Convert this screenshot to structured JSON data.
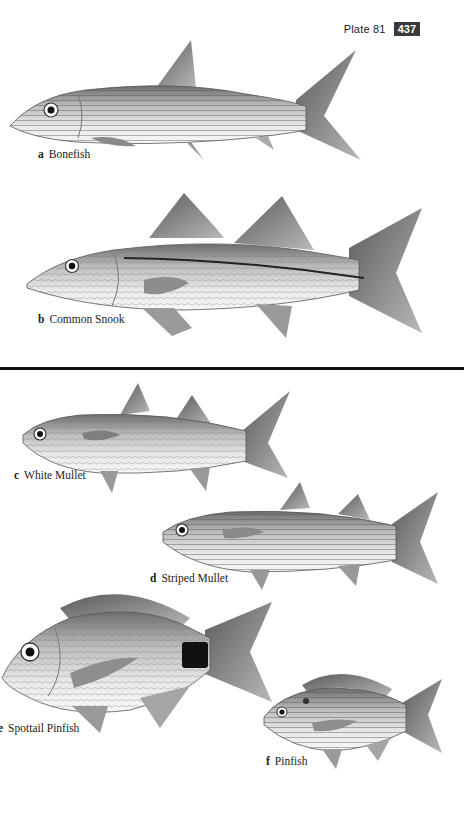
{
  "header": {
    "plate_label": "Plate 81",
    "page_number": "437"
  },
  "species": [
    {
      "letter": "a",
      "name": "Bonefish",
      "icon": "bonefish-illustration"
    },
    {
      "letter": "b",
      "name": "Common Snook",
      "icon": "common-snook-illustration"
    },
    {
      "letter": "c",
      "name": "White Mullet",
      "icon": "white-mullet-illustration"
    },
    {
      "letter": "d",
      "name": "Striped Mullet",
      "icon": "striped-mullet-illustration"
    },
    {
      "letter": "e",
      "name": "Spottail Pinfish",
      "icon": "spottail-pinfish-illustration"
    },
    {
      "letter": "f",
      "name": "Pinfish",
      "icon": "pinfish-illustration"
    }
  ],
  "colors": {
    "background": "#ffffff",
    "ink": "#1a1a1a",
    "page_badge": "#3a3a3a",
    "divider": "#111111"
  }
}
